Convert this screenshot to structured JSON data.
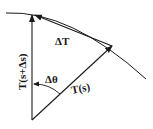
{
  "diagram": {
    "type": "vector-geometry",
    "labels": {
      "delta_T": "ΔT",
      "T_s_plus_ds": "T(s+Δs)",
      "delta_theta": "Δθ",
      "T_s": "T(s)"
    },
    "colors": {
      "stroke": "#1a1a1a",
      "background": "#ffffff"
    }
  }
}
